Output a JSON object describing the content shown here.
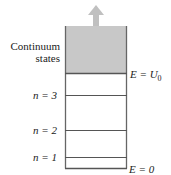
{
  "diagram": {
    "continuum_label_line1": "Continuum",
    "continuum_label_line2": "states",
    "top_energy_label": "E = U",
    "top_energy_subscript": "0",
    "bottom_energy_label": "E = 0",
    "levels": [
      {
        "label": "n = 3"
      },
      {
        "label": "n = 2"
      },
      {
        "label": "n = 1"
      }
    ],
    "colors": {
      "continuum_fill": "#c8c8c8",
      "arrow": "#c0c0c0",
      "lines": "#555555"
    }
  }
}
